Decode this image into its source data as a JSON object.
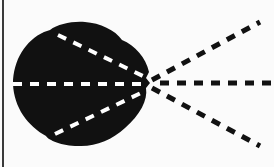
{
  "diagram": {
    "colors": {
      "background": "#fbfbfb",
      "blob": "#111111",
      "inner_dash": "#ffffff",
      "outer_dash": "#111111",
      "border": "#3a3a3a"
    },
    "focal_point": {
      "x": 150,
      "y": 83
    },
    "inner_lines": [
      {
        "name": "upper",
        "x1": 58,
        "y1": 35,
        "x2": 143,
        "y2": 76
      },
      {
        "name": "middle",
        "x1": 13,
        "y1": 84,
        "x2": 143,
        "y2": 84
      },
      {
        "name": "lower",
        "x1": 55,
        "y1": 134,
        "x2": 143,
        "y2": 92
      }
    ],
    "outer_lines": [
      {
        "name": "upper",
        "x1": 152,
        "y1": 80,
        "x2": 260,
        "y2": 22
      },
      {
        "name": "middle",
        "x1": 160,
        "y1": 83,
        "x2": 272,
        "y2": 83
      },
      {
        "name": "lower",
        "x1": 152,
        "y1": 88,
        "x2": 260,
        "y2": 146
      }
    ]
  }
}
